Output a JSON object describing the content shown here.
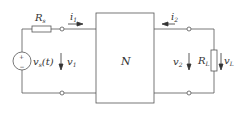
{
  "diagram": {
    "type": "two-port network circuit",
    "network_label": "N",
    "source": {
      "label_main": "v",
      "label_sub": "s",
      "label_arg": "(t)",
      "symbol": "+/-"
    },
    "source_resistor": {
      "label_main": "R",
      "label_sub": "s"
    },
    "load_resistor": {
      "label_main": "R",
      "label_sub": "L"
    },
    "input_current": {
      "label_main": "i",
      "label_sub": "1"
    },
    "output_current": {
      "label_main": "i",
      "label_sub": "2"
    },
    "input_voltage": {
      "label_main": "v",
      "label_sub": "1"
    },
    "output_voltage": {
      "label_main": "v",
      "label_sub": "2"
    },
    "load_voltage": {
      "label_main": "v",
      "label_sub": "L"
    },
    "colors": {
      "line": "#555555",
      "background": "#ffffff"
    }
  }
}
